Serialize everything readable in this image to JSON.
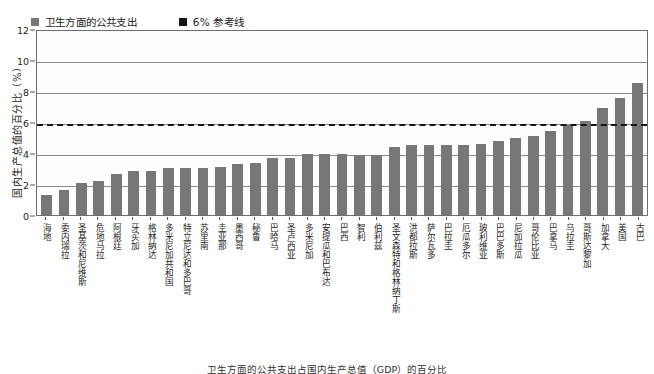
{
  "chart_data": {
    "type": "bar",
    "title": "",
    "xlabel": "",
    "ylabel": "国内生产总值的百分比（%）",
    "ylim": [
      0,
      12
    ],
    "yticks": [
      0,
      2,
      4,
      6,
      8,
      10,
      12
    ],
    "ytick_labels": [
      "0",
      "2",
      "4",
      "6",
      "8",
      "10",
      "12"
    ],
    "grid": true,
    "legend_position": "top-left",
    "bar_color": "#777777",
    "reference_line_color": "#161616",
    "reference_line_value": 6,
    "legend": [
      {
        "label": "卫生方面的公共支出",
        "color": "#777777",
        "marker": "square"
      },
      {
        "label": "6% 参考线",
        "color": "#161616",
        "marker": "square"
      }
    ],
    "categories": [
      "海地",
      "委内瑞拉",
      "圣基茨和尼维斯",
      "危地马拉",
      "阿根廷",
      "牙买加",
      "格林纳达",
      "多米尼加共和国",
      "特立尼达和多巴哥",
      "苏里南",
      "圭亚那",
      "墨西哥",
      "秘鲁",
      "巴哈马",
      "圣卢西亚",
      "多米尼加",
      "安提瓜和巴布达",
      "巴西",
      "智利",
      "伯利兹",
      "圣文森特和格林纳丁斯",
      "洪都拉斯",
      "萨尔瓦多",
      "巴拉圭",
      "厄瓜多尔",
      "玻利维亚",
      "巴巴多斯",
      "尼加拉瓜",
      "哥伦比亚",
      "巴拿马",
      "乌拉圭",
      "哥斯达黎加",
      "加拿大",
      "美国",
      "古巴"
    ],
    "values": [
      1.3,
      1.6,
      2.1,
      2.25,
      2.65,
      2.85,
      2.85,
      3.05,
      3.05,
      3.05,
      3.15,
      3.3,
      3.4,
      3.75,
      3.75,
      3.95,
      3.95,
      3.95,
      3.9,
      3.9,
      4.45,
      4.55,
      4.55,
      4.55,
      4.55,
      4.65,
      4.8,
      5.0,
      5.15,
      5.5,
      5.85,
      6.15,
      6.95,
      7.6,
      8.6
    ],
    "series": [
      {
        "name": "卫生方面的公共支出",
        "values": [
          1.3,
          1.6,
          2.1,
          2.25,
          2.65,
          2.85,
          2.85,
          3.05,
          3.05,
          3.05,
          3.15,
          3.3,
          3.4,
          3.75,
          3.75,
          3.95,
          3.95,
          3.95,
          3.9,
          3.9,
          4.45,
          4.55,
          4.55,
          4.55,
          4.55,
          4.65,
          4.8,
          5.0,
          5.15,
          5.5,
          5.85,
          6.15,
          6.95,
          7.6,
          8.6
        ]
      }
    ]
  },
  "caption": "卫生方面的公共支出占国内生产总值（GDP）的百分比"
}
